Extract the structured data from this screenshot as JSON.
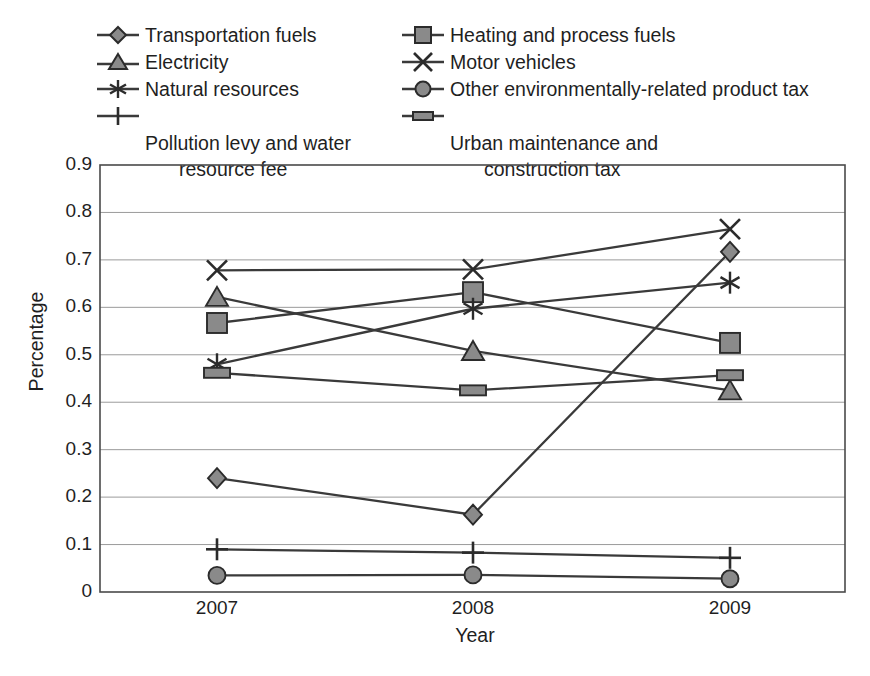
{
  "chart_data": {
    "type": "line",
    "title": "",
    "xlabel": "Year",
    "ylabel": "Percentage",
    "categories": [
      "2007",
      "2008",
      "2009"
    ],
    "x": [
      2007,
      2008,
      2009
    ],
    "ylim": [
      0,
      0.9
    ],
    "yticks": [
      "0",
      "0.1",
      "0.2",
      "0.3",
      "0.4",
      "0.5",
      "0.6",
      "0.7",
      "0.8",
      "0.9"
    ],
    "ytick_values": [
      0,
      0.1,
      0.2,
      0.3,
      0.4,
      0.5,
      0.6,
      0.7,
      0.8,
      0.9
    ],
    "grid": true,
    "legend_position": "top",
    "series": [
      {
        "name": "Transportation fuels",
        "marker": "diamond",
        "values": [
          0.24,
          0.163,
          0.717
        ]
      },
      {
        "name": "Heating and process fuels",
        "marker": "square",
        "values": [
          0.567,
          0.632,
          0.525
        ]
      },
      {
        "name": "Electricity",
        "marker": "triangle",
        "values": [
          0.622,
          0.508,
          0.425
        ]
      },
      {
        "name": "Motor vehicles",
        "marker": "cross",
        "values": [
          0.678,
          0.68,
          0.765
        ]
      },
      {
        "name": "Natural resources",
        "marker": "asterisk",
        "values": [
          0.48,
          0.597,
          0.652
        ]
      },
      {
        "name": "Other environmentally-related product tax",
        "marker": "circle",
        "values": [
          0.035,
          0.036,
          0.028
        ]
      },
      {
        "name": "Pollution levy and water\nresource fee",
        "marker": "plus",
        "values": [
          0.09,
          0.083,
          0.072
        ]
      },
      {
        "name": "Urban maintenance and\nconstruction tax",
        "marker": "hrect",
        "values": [
          0.462,
          0.425,
          0.457
        ]
      }
    ]
  },
  "legend": {
    "left_column": [
      {
        "label": "Transportation fuels",
        "marker": "diamond-marker-icon"
      },
      {
        "label": "Electricity",
        "marker": "triangle-marker-icon"
      },
      {
        "label": "Natural resources",
        "marker": "asterisk-marker-icon"
      },
      {
        "label_line1": "Pollution levy and water",
        "label_line2": "resource fee",
        "marker": "plus-marker-icon"
      }
    ],
    "right_column": [
      {
        "label": "Heating and process fuels",
        "marker": "square-marker-icon"
      },
      {
        "label": "Motor vehicles",
        "marker": "cross-marker-icon"
      },
      {
        "label": "Other environmentally-related product tax",
        "marker": "circle-marker-icon"
      },
      {
        "label_line1": "Urban maintenance and",
        "label_line2": "construction tax",
        "marker": "hrect-marker-icon"
      }
    ]
  },
  "axes": {
    "y_title": "Percentage",
    "x_title": "Year",
    "y_labels": [
      "0.9",
      "0.8",
      "0.7",
      "0.6",
      "0.5",
      "0.4",
      "0.3",
      "0.2",
      "0.1",
      "0"
    ],
    "x_labels": [
      "2007",
      "2008",
      "2009"
    ]
  },
  "colors": {
    "line": "#3a3a3a",
    "marker_fill": "#8a8a8a",
    "marker_stroke": "#2b2b2b",
    "grid": "#9b9b9b",
    "frame": "#4a4a4a",
    "text": "#1f1f1f",
    "background": "#ffffff"
  }
}
